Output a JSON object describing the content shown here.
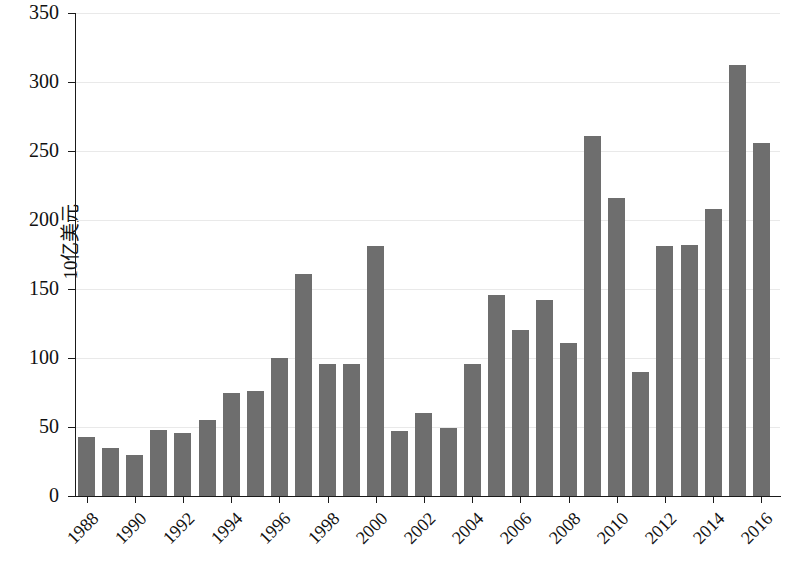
{
  "chart_data": {
    "type": "bar",
    "title": "",
    "xlabel": "",
    "ylabel": "10亿美元",
    "ylim": [
      0,
      350
    ],
    "yticks": [
      0,
      50,
      100,
      150,
      200,
      250,
      300,
      350
    ],
    "ytick_labels": [
      "0",
      "50",
      "100",
      "150",
      "200",
      "250",
      "300",
      "350"
    ],
    "grid": true,
    "legend": "none",
    "bar_color": "#6e6e6e",
    "categories": [
      "1988",
      "1989",
      "1990",
      "1991",
      "1992",
      "1993",
      "1994",
      "1995",
      "1996",
      "1997",
      "1998",
      "1999",
      "2000",
      "2001",
      "2002",
      "2003",
      "2004",
      "2005",
      "2006",
      "2007",
      "2008",
      "2009",
      "2010",
      "2011",
      "2012",
      "2013",
      "2014",
      "2015",
      "2016"
    ],
    "xtick_labels": [
      "1988",
      "1990",
      "1992",
      "1994",
      "1996",
      "1998",
      "2000",
      "2002",
      "2004",
      "2006",
      "2008",
      "2010",
      "2012",
      "2014",
      "2016"
    ],
    "values": [
      43,
      35,
      30,
      48,
      46,
      55,
      75,
      76,
      100,
      161,
      96,
      96,
      181,
      47,
      60,
      49,
      96,
      146,
      120,
      142,
      111,
      261,
      216,
      90,
      181,
      182,
      208,
      312,
      256
    ]
  },
  "caption": ""
}
